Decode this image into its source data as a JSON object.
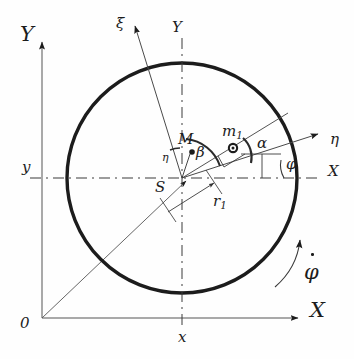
{
  "figure": {
    "kind": "technical-diagram",
    "ink_color": "#1c1c1c",
    "thin_color": "#555555",
    "background": "#fefefe"
  },
  "labels": {
    "global_y_axis": "Y",
    "global_x_axis": "X",
    "origin": "0",
    "coord_x": "x",
    "coord_y": "y",
    "rotor_y_axis": "Y",
    "rotor_x_axis": "X",
    "xi_axis": "ξ",
    "eta_axis": "η",
    "center": "S",
    "mass_point": "m",
    "mass_point_sub": "1",
    "radius": "r",
    "radius_sub": "1",
    "center_of_mass": "M",
    "angle_alpha": "α",
    "angle_beta": "β",
    "angle_phi": "φ",
    "angle_eta_small": "η",
    "angular_velocity": "φ"
  },
  "geometry": {
    "circle": {
      "cx": 182,
      "cy": 178,
      "r": 115
    },
    "global_origin": {
      "x": 42,
      "y": 318
    },
    "center_S": {
      "x": 182,
      "y": 178
    },
    "mass_m1": {
      "x": 233,
      "y": 148
    },
    "point_M": {
      "x": 192,
      "y": 152
    },
    "xi_tip": {
      "x": 133,
      "y": 22
    },
    "eta_tip": {
      "x": 322,
      "y": 132
    },
    "x_axis_tip": {
      "x": 300,
      "y": 318
    },
    "y_axis_tip": {
      "x": 42,
      "y": 40
    },
    "phi_deg": 17,
    "alpha_deg": 17,
    "beta_deg": 47
  }
}
